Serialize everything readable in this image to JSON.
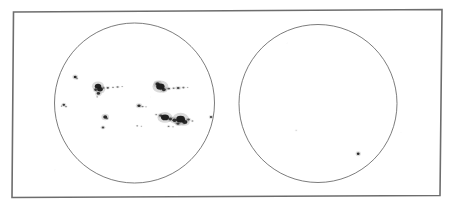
{
  "document": {
    "type": "solar-disk-sunspot-drawing",
    "background_color": "#ffffff",
    "ink_color": "#1a1a1a",
    "frame_line_color": "#6d6d6d",
    "disk_outline_color": "#5a5a5a",
    "canvas": {
      "width": 456,
      "height": 207
    }
  },
  "chart_data": {
    "type": "scatter",
    "title": "",
    "subtitle": "",
    "xlabel": "",
    "ylabel": "",
    "grid": false,
    "legend": null,
    "annotations": [],
    "frame": {
      "label": "drawing-sheet-border",
      "points": [
        [
          13.5,
          12.0
        ],
        [
          442.0,
          9.5
        ],
        [
          440.0,
          195.5
        ],
        [
          12.0,
          197.5
        ]
      ],
      "stroke_width": 1.6
    },
    "panels": [
      {
        "name": "left-solar-disk",
        "shape": "circle",
        "cx": 134.5,
        "cy": 103.0,
        "r": 80.0,
        "stroke_width": 0.8,
        "spot_count": 33,
        "spots": [
          {
            "x": 75.2,
            "y": 77.0,
            "rx": 1.5,
            "ry": 1.3,
            "opacity": 0.92
          },
          {
            "x": 77.0,
            "y": 78.6,
            "rx": 0.8,
            "ry": 0.7,
            "opacity": 0.55
          },
          {
            "x": 63.8,
            "y": 104.8,
            "rx": 1.3,
            "ry": 1.1,
            "opacity": 0.85
          },
          {
            "x": 66.0,
            "y": 106.6,
            "rx": 0.8,
            "ry": 0.7,
            "opacity": 0.6
          },
          {
            "x": 61.5,
            "y": 106.2,
            "rx": 0.6,
            "ry": 0.6,
            "opacity": 0.4
          },
          {
            "x": 98.0,
            "y": 86.2,
            "rx": 3.2,
            "ry": 2.5,
            "opacity": 0.96
          },
          {
            "x": 100.0,
            "y": 89.2,
            "rx": 2.8,
            "ry": 2.2,
            "opacity": 0.95
          },
          {
            "x": 95.6,
            "y": 89.8,
            "rx": 1.4,
            "ry": 1.2,
            "opacity": 0.8
          },
          {
            "x": 98.4,
            "y": 93.4,
            "rx": 1.7,
            "ry": 1.4,
            "opacity": 0.88
          },
          {
            "x": 103.6,
            "y": 88.0,
            "rx": 0.9,
            "ry": 0.8,
            "opacity": 0.6
          },
          {
            "x": 107.8,
            "y": 87.8,
            "rx": 1.2,
            "ry": 0.9,
            "opacity": 0.72
          },
          {
            "x": 113.0,
            "y": 87.4,
            "rx": 0.8,
            "ry": 0.6,
            "opacity": 0.5
          },
          {
            "x": 117.6,
            "y": 87.0,
            "rx": 1.1,
            "ry": 0.7,
            "opacity": 0.6
          },
          {
            "x": 122.2,
            "y": 86.6,
            "rx": 0.7,
            "ry": 0.5,
            "opacity": 0.38
          },
          {
            "x": 97.2,
            "y": 96.8,
            "rx": 0.7,
            "ry": 0.6,
            "opacity": 0.45
          },
          {
            "x": 105.2,
            "y": 117.0,
            "rx": 2.0,
            "ry": 1.7,
            "opacity": 0.93
          },
          {
            "x": 107.0,
            "y": 118.4,
            "rx": 1.0,
            "ry": 0.8,
            "opacity": 0.6
          },
          {
            "x": 103.0,
            "y": 127.4,
            "rx": 1.3,
            "ry": 1.0,
            "opacity": 0.78
          },
          {
            "x": 139.0,
            "y": 105.8,
            "rx": 1.7,
            "ry": 1.3,
            "opacity": 0.9
          },
          {
            "x": 142.6,
            "y": 106.6,
            "rx": 1.0,
            "ry": 0.6,
            "opacity": 0.55
          },
          {
            "x": 146.0,
            "y": 106.8,
            "rx": 0.7,
            "ry": 0.5,
            "opacity": 0.35
          },
          {
            "x": 137.2,
            "y": 125.8,
            "rx": 0.8,
            "ry": 0.6,
            "opacity": 0.5
          },
          {
            "x": 141.4,
            "y": 126.2,
            "rx": 0.6,
            "ry": 0.5,
            "opacity": 0.35
          },
          {
            "x": 160.4,
            "y": 86.6,
            "rx": 4.2,
            "ry": 3.2,
            "opacity": 0.97
          },
          {
            "x": 157.6,
            "y": 84.0,
            "rx": 2.2,
            "ry": 1.8,
            "opacity": 0.92
          },
          {
            "x": 163.8,
            "y": 89.6,
            "rx": 2.0,
            "ry": 1.6,
            "opacity": 0.88
          },
          {
            "x": 168.8,
            "y": 88.6,
            "rx": 1.3,
            "ry": 0.9,
            "opacity": 0.7
          },
          {
            "x": 173.6,
            "y": 88.2,
            "rx": 1.0,
            "ry": 0.7,
            "opacity": 0.55
          },
          {
            "x": 178.2,
            "y": 88.0,
            "rx": 1.5,
            "ry": 1.0,
            "opacity": 0.78
          },
          {
            "x": 183.4,
            "y": 87.6,
            "rx": 1.1,
            "ry": 0.8,
            "opacity": 0.58
          },
          {
            "x": 187.6,
            "y": 87.4,
            "rx": 0.7,
            "ry": 0.5,
            "opacity": 0.35
          },
          {
            "x": 165.0,
            "y": 117.4,
            "rx": 4.0,
            "ry": 2.8,
            "opacity": 0.97
          },
          {
            "x": 160.8,
            "y": 115.6,
            "rx": 1.6,
            "ry": 1.2,
            "opacity": 0.8
          },
          {
            "x": 156.2,
            "y": 114.6,
            "rx": 0.9,
            "ry": 0.7,
            "opacity": 0.48
          },
          {
            "x": 170.2,
            "y": 119.0,
            "rx": 1.8,
            "ry": 1.4,
            "opacity": 0.82
          },
          {
            "x": 174.6,
            "y": 120.2,
            "rx": 2.2,
            "ry": 1.7,
            "opacity": 0.88
          },
          {
            "x": 180.6,
            "y": 119.2,
            "rx": 4.4,
            "ry": 3.4,
            "opacity": 0.98
          },
          {
            "x": 184.8,
            "y": 122.0,
            "rx": 2.6,
            "ry": 2.0,
            "opacity": 0.92
          },
          {
            "x": 178.0,
            "y": 123.6,
            "rx": 1.6,
            "ry": 1.2,
            "opacity": 0.78
          },
          {
            "x": 188.6,
            "y": 119.6,
            "rx": 1.4,
            "ry": 1.0,
            "opacity": 0.68
          },
          {
            "x": 192.4,
            "y": 121.0,
            "rx": 0.9,
            "ry": 0.7,
            "opacity": 0.45
          },
          {
            "x": 168.6,
            "y": 126.4,
            "rx": 0.9,
            "ry": 0.7,
            "opacity": 0.55
          },
          {
            "x": 173.0,
            "y": 126.8,
            "rx": 0.7,
            "ry": 0.5,
            "opacity": 0.4
          },
          {
            "x": 211.0,
            "y": 117.0,
            "rx": 1.2,
            "ry": 1.0,
            "opacity": 0.8
          }
        ]
      },
      {
        "name": "right-solar-disk",
        "shape": "circle",
        "cx": 318.0,
        "cy": 103.5,
        "r": 79.0,
        "stroke_width": 0.8,
        "spot_count": 2,
        "spots": [
          {
            "x": 358.2,
            "y": 153.8,
            "rx": 1.4,
            "ry": 1.3,
            "opacity": 0.92
          },
          {
            "x": 296.2,
            "y": 130.4,
            "rx": 0.8,
            "ry": 0.7,
            "opacity": 0.14
          }
        ]
      }
    ]
  }
}
